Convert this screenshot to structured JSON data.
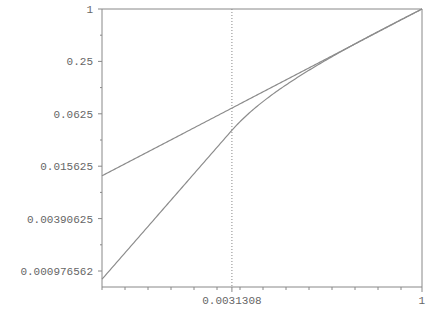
{
  "chart_data": {
    "type": "line",
    "title": "",
    "xlabel": "",
    "ylabel": "",
    "x_scale": "log",
    "y_scale": "log",
    "xlim": [
      6.08e-05,
      1
    ],
    "ylim": [
      0.000976562,
      1
    ],
    "grid": false,
    "legend": null,
    "y_ticks": [
      "1",
      "0.25",
      "0.0625",
      "0.015625",
      "0.00390625",
      "0.000976562"
    ],
    "y_tick_values": [
      1,
      0.25,
      0.0625,
      0.015625,
      0.00390625,
      0.000976562
    ],
    "x_ticks": [
      "0.0031308",
      "1"
    ],
    "x_tick_values": [
      0.0031308,
      1
    ],
    "annotations": [
      {
        "type": "vertical-dotted-line",
        "x": 0.0031308
      }
    ],
    "series": [
      {
        "name": "power-curve",
        "formula": "y = x^(1/2.2)",
        "x": [
          6.08e-05,
          0.0001,
          0.001,
          0.0031308,
          0.01,
          0.1,
          1
        ],
        "values": [
          0.0121,
          0.0152,
          0.0433,
          0.0728,
          0.1233,
          0.3511,
          1
        ]
      },
      {
        "name": "srgb-transfer-curve",
        "formula": "y = 12.92x (x <= 0.0031308); 1.055x^(1/2.4) - 0.055 otherwise",
        "x": [
          6.08e-05,
          0.0001,
          0.001,
          0.0031308,
          0.01,
          0.1,
          1
        ],
        "values": [
          0.000786,
          0.001292,
          0.01292,
          0.04045,
          0.0998,
          0.3492,
          1
        ]
      }
    ]
  },
  "colors": {
    "axis": "#888888",
    "line": "#8c8c8c",
    "label": "#666666"
  }
}
